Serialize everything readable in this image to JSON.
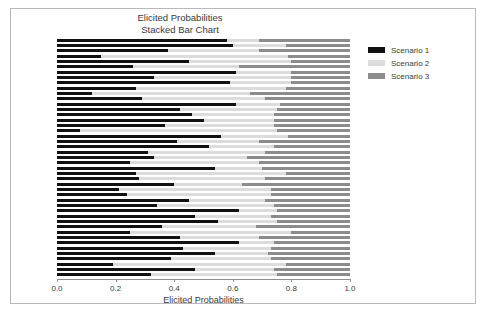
{
  "chart_data": {
    "type": "bar",
    "orientation": "horizontal",
    "stacked": true,
    "normalized": true,
    "title": "Elicited Probabilities\nStacked Bar Chart",
    "title_line1": "Elicited Probabilities",
    "title_line2": "Stacked Bar Chart",
    "xlabel": "Elicited Probabilities",
    "ylabel": "",
    "xlim": [
      0.0,
      1.0
    ],
    "xticks": [
      0.0,
      0.2,
      0.4,
      0.6,
      0.8,
      1.0
    ],
    "xticklabels": [
      "0.0",
      "0.2",
      "0.4",
      "0.6",
      "0.8",
      "1.0"
    ],
    "grid": false,
    "legend_position": "right",
    "n_bars": 45,
    "colors": {
      "scenario_1": "#111111",
      "scenario_2": "#dcdcdc",
      "scenario_3": "#8c8c8c",
      "frame": "#b9b9b9",
      "axis": "#8f8f8f",
      "text": "#3a3a3a",
      "background": "#ffffff"
    },
    "series": [
      {
        "name": "Scenario 1",
        "color": "#111111",
        "values": [
          0.58,
          0.6,
          0.38,
          0.15,
          0.45,
          0.26,
          0.61,
          0.33,
          0.59,
          0.27,
          0.12,
          0.29,
          0.61,
          0.42,
          0.46,
          0.5,
          0.37,
          0.08,
          0.56,
          0.41,
          0.52,
          0.31,
          0.33,
          0.25,
          0.54,
          0.27,
          0.28,
          0.4,
          0.21,
          0.24,
          0.45,
          0.34,
          0.62,
          0.47,
          0.55,
          0.36,
          0.25,
          0.42,
          0.62,
          0.43,
          0.54,
          0.39,
          0.19,
          0.47,
          0.32
        ]
      },
      {
        "name": "Scenario 2",
        "color": "#dcdcdc",
        "values": [
          0.11,
          0.18,
          0.31,
          0.64,
          0.35,
          0.36,
          0.19,
          0.47,
          0.21,
          0.51,
          0.54,
          0.42,
          0.15,
          0.33,
          0.28,
          0.24,
          0.37,
          0.67,
          0.23,
          0.28,
          0.22,
          0.4,
          0.32,
          0.44,
          0.16,
          0.51,
          0.43,
          0.23,
          0.52,
          0.49,
          0.26,
          0.4,
          0.13,
          0.26,
          0.2,
          0.32,
          0.55,
          0.27,
          0.12,
          0.3,
          0.18,
          0.34,
          0.59,
          0.27,
          0.43
        ]
      },
      {
        "name": "Scenario 3",
        "color": "#8c8c8c",
        "values": [
          0.31,
          0.22,
          0.31,
          0.21,
          0.2,
          0.38,
          0.2,
          0.2,
          0.2,
          0.22,
          0.34,
          0.29,
          0.24,
          0.25,
          0.26,
          0.26,
          0.26,
          0.25,
          0.21,
          0.31,
          0.26,
          0.29,
          0.35,
          0.31,
          0.3,
          0.22,
          0.29,
          0.37,
          0.27,
          0.27,
          0.29,
          0.26,
          0.25,
          0.27,
          0.25,
          0.32,
          0.2,
          0.31,
          0.26,
          0.27,
          0.28,
          0.27,
          0.22,
          0.26,
          0.25
        ]
      }
    ],
    "legend": [
      {
        "label": "Scenario 1",
        "color": "#111111"
      },
      {
        "label": "Scenario 2",
        "color": "#dcdcdc"
      },
      {
        "label": "Scenario 3",
        "color": "#8c8c8c"
      }
    ]
  }
}
